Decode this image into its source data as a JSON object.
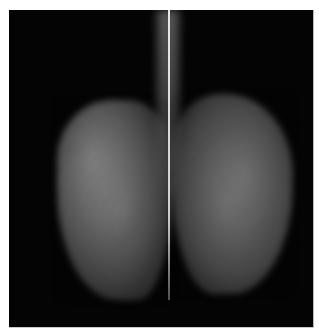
{
  "image": {
    "description": "Grayscale radiographic image showing two symmetric textured tissue regions with a bright vertical line along the center",
    "background_color": "#040404",
    "border_color": "#ffffff"
  }
}
